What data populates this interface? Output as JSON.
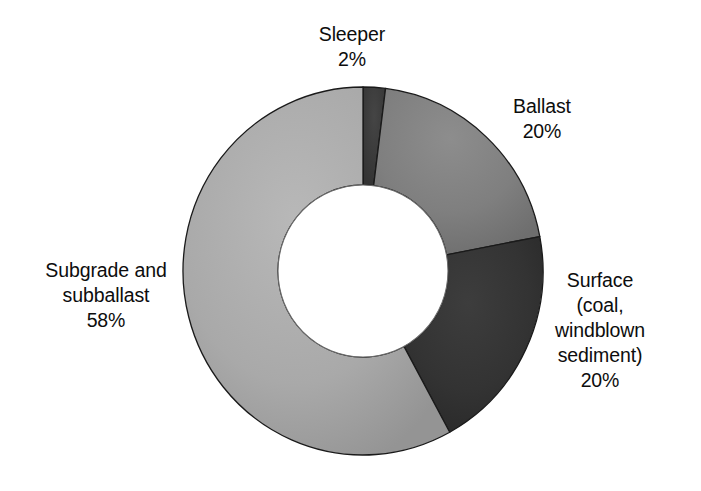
{
  "chart_data": {
    "type": "pie",
    "variant": "donut",
    "title": "",
    "subtitle": "",
    "xlabel": "",
    "ylabel": "",
    "legend_position": "none",
    "grid": false,
    "units": "percent",
    "total": 100,
    "categories": [
      "Sleeper",
      "Ballast",
      "Surface (coal, windblown sediment)",
      "Subgrade and subballast"
    ],
    "values": [
      2,
      20,
      20,
      58
    ],
    "slices": [
      {
        "name": "Sleeper",
        "label_lines": [
          "Sleeper",
          "2%"
        ],
        "value": 2,
        "value_text": "2%",
        "color": "#3b3b3b",
        "start_angle_deg": 0,
        "end_angle_deg": 7.2
      },
      {
        "name": "Ballast",
        "label_lines": [
          "Ballast",
          "20%"
        ],
        "value": 20,
        "value_text": "20%",
        "color": "#7f7f7f",
        "start_angle_deg": 7.2,
        "end_angle_deg": 79.2
      },
      {
        "name": "Surface (coal, windblown sediment)",
        "label_lines": [
          "Surface",
          "(coal,",
          "windblown",
          "sediment)",
          "20%"
        ],
        "value": 20,
        "value_text": "20%",
        "color": "#333333",
        "start_angle_deg": 79.2,
        "end_angle_deg": 151.2
      },
      {
        "name": "Subgrade and subballast",
        "label_lines": [
          "Subgrade and",
          "subballast",
          "58%"
        ],
        "value": 58,
        "value_text": "58%",
        "color": "#a9a9a9",
        "start_angle_deg": 151.2,
        "end_angle_deg": 360
      }
    ]
  },
  "labels": {
    "sleeper": "Sleeper\n2%",
    "ballast": "Ballast\n20%",
    "surface": "Surface\n(coal,\nwindblown\nsediment)\n20%",
    "subgrade": "Subgrade and\nsubballast\n58%"
  },
  "colors": {
    "background": "#ffffff",
    "text": "#0d0d0d",
    "sleeper": "#3b3b3b",
    "ballast": "#7f7f7f",
    "surface": "#333333",
    "subgrade": "#a9a9a9",
    "slice_border": "#1a1a1a"
  }
}
